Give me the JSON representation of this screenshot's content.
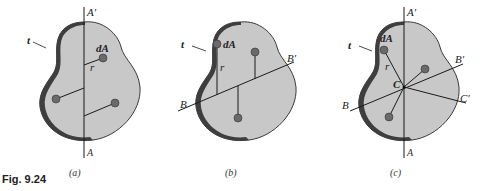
{
  "figure": {
    "caption": "Fig. 9.24",
    "panels": [
      {
        "id": "a",
        "label": "(a)",
        "axis_labels": {
          "top": "A′",
          "bottom": "A"
        },
        "annotations": {
          "thickness": "t",
          "element": "dA",
          "distance": "r"
        }
      },
      {
        "id": "b",
        "label": "(b)",
        "axis_labels": {
          "left": "B",
          "right": "B′"
        },
        "annotations": {
          "thickness": "t",
          "element": "dA",
          "distance": "r"
        }
      },
      {
        "id": "c",
        "label": "(c)",
        "axis_labels": {
          "top": "A′",
          "bottom": "A",
          "left": "B",
          "right": "B′",
          "right2": "C′",
          "center": "C"
        },
        "annotations": {
          "thickness": "t",
          "element": "dA",
          "distance": "r"
        }
      }
    ],
    "colors": {
      "plate_fill": "#c8c8c8",
      "edge": "#3a3a3a",
      "element": "#6a6a6a",
      "line": "#1a1a1a"
    }
  }
}
